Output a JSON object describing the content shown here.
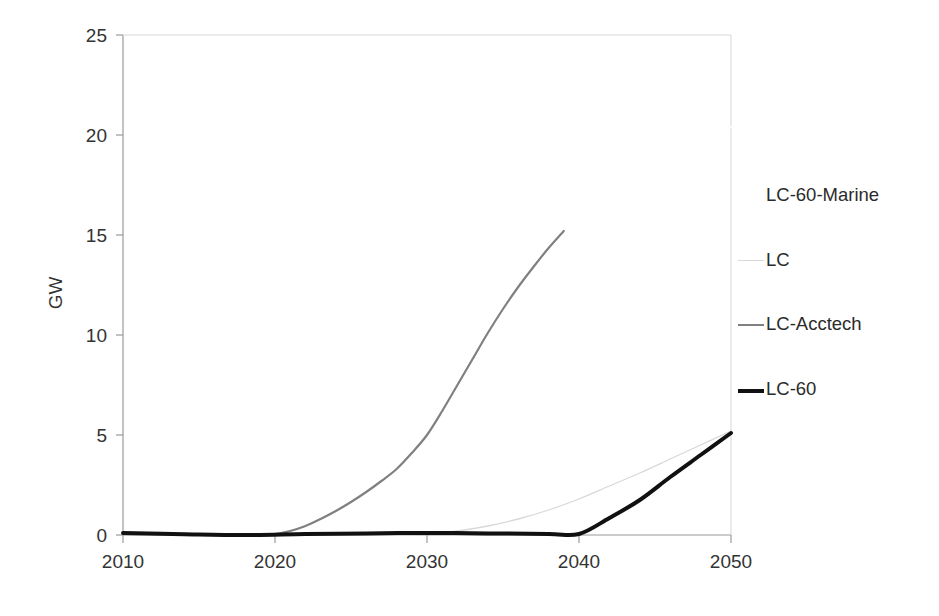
{
  "chart_data": {
    "type": "line",
    "title": "",
    "subtitle": "",
    "xlabel": "",
    "ylabel": "GW",
    "xlim": [
      2010,
      2050
    ],
    "ylim": [
      0,
      25
    ],
    "xticks": [
      2010,
      2020,
      2030,
      2040,
      2050
    ],
    "yticks": [
      0,
      5,
      10,
      15,
      20,
      25
    ],
    "grid": false,
    "legend_position": "right",
    "background": "#ffffff",
    "axis_color": "#808080",
    "series": [
      {
        "name": "LC-60-Marine",
        "color": "#ffffff",
        "width": 2.0,
        "legend_swatch_visible": false,
        "x": [
          2043,
          2044,
          2045,
          2046,
          2047,
          2048,
          2049,
          2050
        ],
        "values": [
          18.0,
          18.45,
          18.85,
          19.2,
          19.5,
          19.8,
          20.1,
          20.4
        ]
      },
      {
        "name": "LC",
        "color": "#d8d8d8",
        "width": 1.3,
        "legend_swatch_visible": true,
        "x": [
          2010,
          2013,
          2016,
          2020,
          2024,
          2028,
          2030,
          2032,
          2034,
          2036,
          2038,
          2040,
          2042,
          2044,
          2046,
          2048,
          2050
        ],
        "values": [
          0.05,
          0.02,
          0.0,
          0.0,
          0.0,
          0.0,
          0.05,
          0.2,
          0.45,
          0.8,
          1.25,
          1.8,
          2.45,
          3.1,
          3.8,
          4.5,
          5.2
        ]
      },
      {
        "name": "LC-Acctech",
        "color": "#808080",
        "width": 2.2,
        "legend_swatch_visible": true,
        "x": [
          2010,
          2014,
          2018,
          2020,
          2021,
          2022,
          2023,
          2024,
          2025,
          2026,
          2027,
          2028,
          2029,
          2030,
          2031,
          2032,
          2033,
          2034,
          2035,
          2036,
          2037,
          2038,
          2039
        ],
        "values": [
          0.08,
          0.02,
          0.0,
          0.05,
          0.2,
          0.45,
          0.8,
          1.2,
          1.65,
          2.15,
          2.7,
          3.3,
          4.1,
          5.0,
          6.2,
          7.5,
          8.8,
          10.1,
          11.3,
          12.4,
          13.4,
          14.35,
          15.2
        ]
      },
      {
        "name": "LC-60",
        "color": "#111111",
        "width": 4.0,
        "legend_swatch_visible": true,
        "x": [
          2010,
          2014,
          2018,
          2022,
          2026,
          2030,
          2034,
          2038,
          2040,
          2042,
          2044,
          2046,
          2048,
          2050
        ],
        "values": [
          0.1,
          0.04,
          0.0,
          0.05,
          0.08,
          0.1,
          0.08,
          0.05,
          0.05,
          0.85,
          1.75,
          2.9,
          4.0,
          5.1
        ]
      }
    ]
  },
  "axes": {
    "y_tick_labels": [
      "25",
      "20",
      "15",
      "10",
      "5",
      "0"
    ],
    "x_tick_labels": [
      "2010",
      "2020",
      "2030",
      "2040",
      "2050"
    ],
    "y_axis_title": "GW"
  },
  "legend": {
    "entries": [
      {
        "label": "LC-60-Marine",
        "color": "#ffffff",
        "swatch_visible": false,
        "width": 2.0
      },
      {
        "label": "LC",
        "color": "#d8d8d8",
        "swatch_visible": true,
        "width": 1.3
      },
      {
        "label": "LC-Acctech",
        "color": "#808080",
        "swatch_visible": true,
        "width": 2.2
      },
      {
        "label": "LC-60",
        "color": "#111111",
        "swatch_visible": true,
        "width": 4.0
      }
    ]
  }
}
